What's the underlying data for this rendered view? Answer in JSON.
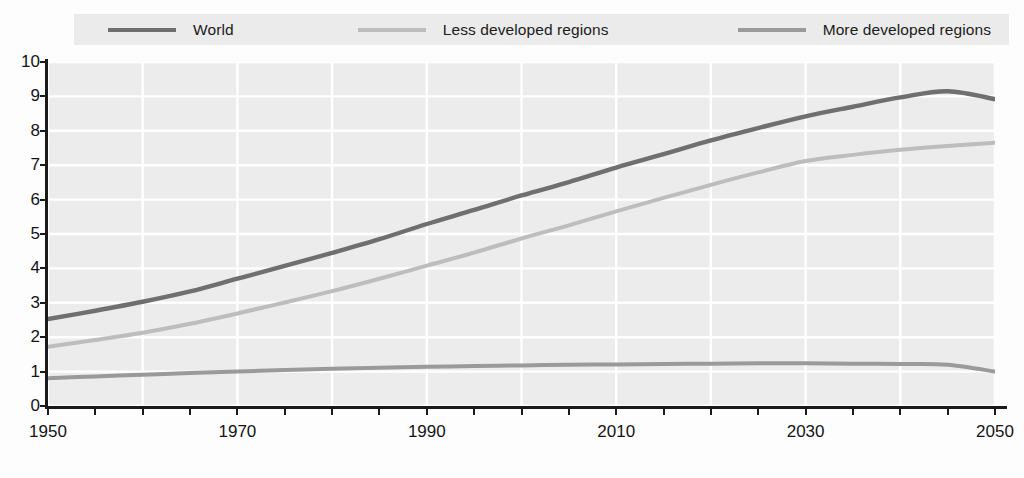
{
  "legend": {
    "entries": [
      {
        "label": "World",
        "color": "#6f6f6f",
        "swatch_name": "legend-swatch-world"
      },
      {
        "label": "Less developed regions",
        "color": "#bdbdbd",
        "swatch_name": "legend-swatch-less-developed"
      },
      {
        "label": "More developed regions",
        "color": "#9a9a9a",
        "swatch_name": "legend-swatch-more-developed"
      }
    ]
  },
  "axes": {
    "y_ticks": [
      "10",
      "9",
      "8",
      "7",
      "6",
      "5",
      "4",
      "3",
      "2",
      "1",
      "0"
    ],
    "x_ticks": [
      "1950",
      "1970",
      "1990",
      "2010",
      "2030",
      "2050"
    ]
  },
  "colors": {
    "plot_background": "#ececec",
    "gridline": "#ffffff",
    "axis": "#1a1a1a",
    "legend_background": "#ebebeb",
    "page_background": "#fdfdfd"
  },
  "chart_data": {
    "type": "line",
    "title": "",
    "subtitle": "",
    "xlabel": "",
    "ylabel": "",
    "xlim": [
      1950,
      2050
    ],
    "ylim": [
      0,
      10
    ],
    "x_tick_step": 20,
    "x_minor_tick_step": 5,
    "y_tick_step": 1,
    "grid": true,
    "legend_position": "top",
    "x": [
      1950,
      1955,
      1960,
      1965,
      1970,
      1975,
      1980,
      1985,
      1990,
      1995,
      2000,
      2005,
      2010,
      2015,
      2020,
      2025,
      2030,
      2035,
      2040,
      2045,
      2050
    ],
    "series": [
      {
        "name": "World",
        "color": "#6f6f6f",
        "values": [
          2.53,
          2.77,
          3.03,
          3.33,
          3.7,
          4.07,
          4.45,
          4.85,
          5.29,
          5.7,
          6.12,
          6.51,
          6.93,
          7.32,
          7.72,
          8.08,
          8.42,
          8.7,
          8.97,
          9.15,
          8.92
        ]
      },
      {
        "name": "Less developed regions",
        "color": "#bdbdbd",
        "values": [
          1.72,
          1.92,
          2.13,
          2.39,
          2.69,
          3.01,
          3.34,
          3.7,
          4.08,
          4.46,
          4.87,
          5.25,
          5.66,
          6.05,
          6.43,
          6.79,
          7.12,
          7.3,
          7.45,
          7.56,
          7.65
        ]
      },
      {
        "name": "More developed regions",
        "color": "#9a9a9a",
        "values": [
          0.81,
          0.86,
          0.91,
          0.96,
          1.0,
          1.05,
          1.08,
          1.11,
          1.14,
          1.16,
          1.18,
          1.2,
          1.21,
          1.22,
          1.23,
          1.24,
          1.24,
          1.23,
          1.22,
          1.2,
          1.0
        ]
      }
    ]
  }
}
